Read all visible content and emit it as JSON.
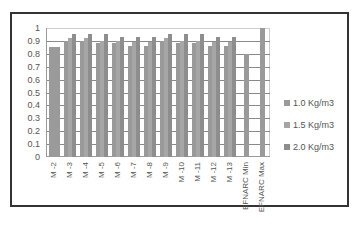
{
  "chart_data": {
    "type": "bar",
    "title": "",
    "xlabel": "",
    "ylabel": "",
    "ylim": [
      0,
      1
    ],
    "yticks": [
      "0",
      "0.1",
      "0.2",
      "0.3",
      "0.4",
      "0.5",
      "0.6",
      "0.7",
      "0.8",
      "0.9",
      "1"
    ],
    "grid": true,
    "legend_position": "right",
    "categories": [
      "M -2",
      "M -3",
      "M -4",
      "M -5",
      "M -6",
      "M -7",
      "M -8",
      "M -9",
      "M -10",
      "M -11",
      "M -12",
      "M -13",
      "EFNARC Min",
      "EFNARC Max"
    ],
    "series": [
      {
        "name": "1.0 Kg/m3",
        "values": [
          0.85,
          0.9,
          0.9,
          0.88,
          0.88,
          0.86,
          0.86,
          0.9,
          0.88,
          0.88,
          0.86,
          0.86,
          0.8,
          1.0
        ]
      },
      {
        "name": "1.5 Kg/m3",
        "values": [
          null,
          0.92,
          0.92,
          0.9,
          0.9,
          0.89,
          0.89,
          0.92,
          0.9,
          0.9,
          0.89,
          0.89,
          null,
          null
        ]
      },
      {
        "name": "2.0 Kg/m3",
        "values": [
          null,
          0.95,
          0.95,
          0.95,
          0.93,
          0.93,
          0.93,
          0.95,
          0.95,
          0.95,
          0.93,
          0.93,
          null,
          null
        ]
      }
    ],
    "colors": [
      "#9a9a9a",
      "#a6a6a6",
      "#8e8e8e"
    ]
  },
  "legend": {
    "items": [
      {
        "label": "1.0 Kg/m3"
      },
      {
        "label": "1.5 Kg/m3"
      },
      {
        "label": "2.0 Kg/m3"
      }
    ]
  }
}
